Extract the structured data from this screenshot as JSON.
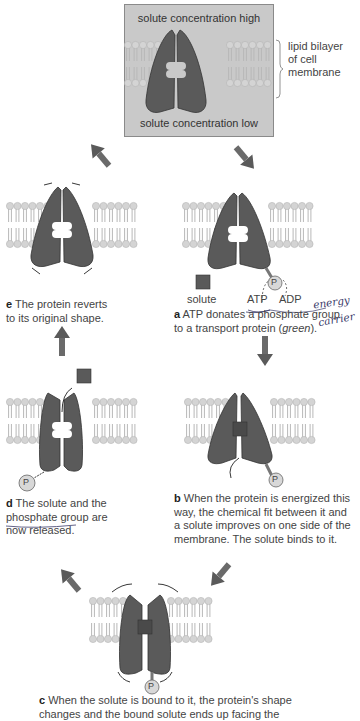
{
  "colors": {
    "protein": "#5a5a5a",
    "protein_stroke": "#333333",
    "lipid_head": "#d4d4d4",
    "lipid_tail": "#e2e2e2",
    "box_bg": "#c9c9c9",
    "arrow": "#666666",
    "handwriting": "#3b3b6a"
  },
  "top_panel": {
    "high_label": "solute concentration high",
    "low_label": "solute concentration low",
    "bracket_label_line1": "lipid bilayer",
    "bracket_label_line2": "of cell",
    "bracket_label_line3": "membrane"
  },
  "steps": {
    "a": {
      "letter": "a",
      "text_line1": " ATP donates a phosphate group",
      "text_line2": "to a transport protein (",
      "text_italic": "green",
      "text_end": ").",
      "solute_label": "solute",
      "atp_label": "ATP",
      "adp_label": "ADP",
      "phosphate": "P"
    },
    "b": {
      "letter": "b",
      "line1": " When the protein is energized this",
      "line2": "way, the chemical fit between it and",
      "line3": "a solute improves on one side of the",
      "line4": "membrane. The solute binds to it.",
      "phosphate": "P"
    },
    "c": {
      "letter": "c",
      "line1": " When the solute is bound to it, the protein's shape",
      "line2": "changes and the bound solute ends up facing the",
      "phosphate": "P"
    },
    "d": {
      "letter": "d",
      "line1": " The solute and the",
      "line2": "phosphate group",
      "line2_end": " are",
      "line3": "now released.",
      "phosphate": "P"
    },
    "e": {
      "letter": "e",
      "line1": " The protein reverts",
      "line2": "to its original shape."
    }
  },
  "annotations": {
    "hand1": "energy",
    "hand2": "carrier"
  }
}
